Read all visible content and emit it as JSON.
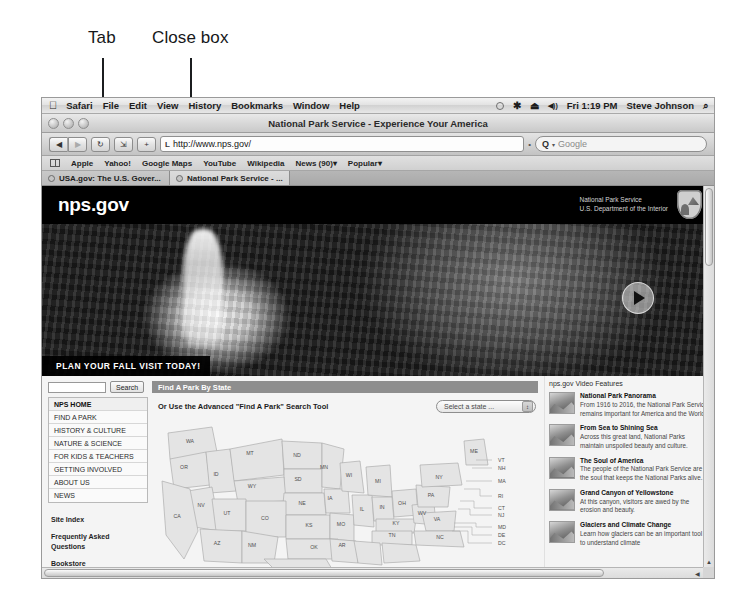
{
  "annotations": [
    {
      "label": "Tab",
      "x": 88,
      "y": 36,
      "line_x": 102,
      "line_top": 58,
      "line_bottom": 112
    },
    {
      "label": "Close box",
      "x": 152,
      "y": 36,
      "line_x": 190,
      "line_top": 58,
      "line_bottom": 112
    }
  ],
  "menubar": {
    "apple_icon": "apple-icon",
    "items": [
      "Safari",
      "File",
      "Edit",
      "View",
      "History",
      "Bookmarks",
      "Window",
      "Help"
    ],
    "status": {
      "spotlight_circle": "",
      "bluetooth_icon": "✱",
      "eject_icon": "⏏",
      "volume_icon": "◀))",
      "clock": "Fri 1:19 PM",
      "user": "Steve Johnson",
      "search_icon": "⌕"
    }
  },
  "window": {
    "title": "National Park Service - Experience Your America",
    "traffic_lights": [
      "close",
      "minimize",
      "zoom"
    ]
  },
  "toolbar": {
    "back_icon": "◀",
    "forward_icon": "▶",
    "reload_icon": "↻",
    "reader_label": "Reader",
    "add_label": "+",
    "url_favicon": "L",
    "url": "http://www.nps.gov/",
    "search_prefix": "Q",
    "search_placeholder": "Google",
    "separator": "•"
  },
  "bookmarks": {
    "show_all_icon": "bookmarks-icon",
    "items": [
      "Apple",
      "Yahoo!",
      "Google Maps",
      "YouTube",
      "Wikipedia",
      "News (90)",
      "Popular"
    ]
  },
  "tabs": [
    {
      "label": "USA.gov: The U.S. Gover...",
      "active": false
    },
    {
      "label": "National Park Service - ...",
      "active": true
    }
  ],
  "hero": {
    "logo": "nps.gov",
    "agency_line1": "National Park Service",
    "agency_line2": "U.S. Department of the Interior",
    "caption": "PLAN YOUR FALL VISIT TODAY!",
    "play_label": "play-button"
  },
  "sidebar": {
    "search_value": "",
    "search_button": "Search",
    "nav": [
      {
        "label": "NPS HOME",
        "current": true
      },
      {
        "label": "FIND A PARK",
        "current": false
      },
      {
        "label": "HISTORY & CULTURE",
        "current": false
      },
      {
        "label": "NATURE & SCIENCE",
        "current": false
      },
      {
        "label": "FOR KIDS & TEACHERS",
        "current": false
      },
      {
        "label": "GETTING INVOLVED",
        "current": false
      },
      {
        "label": "ABOUT US",
        "current": false
      },
      {
        "label": "NEWS",
        "current": false
      }
    ],
    "sublinks": [
      "Site Index",
      "Frequently Asked Questions",
      "Bookstore"
    ]
  },
  "main": {
    "section_title": "Find A Park By State",
    "advanced_text": "Or Use the Advanced \"Find A Park\" Search Tool",
    "state_select_value": "Select a state ...",
    "select_arrow_icon": "↕",
    "map": {
      "states": [
        {
          "abbr": "WA",
          "x": 36,
          "y": 24
        },
        {
          "abbr": "OR",
          "x": 30,
          "y": 50
        },
        {
          "abbr": "ID",
          "x": 62,
          "y": 57
        },
        {
          "abbr": "MT",
          "x": 96,
          "y": 36
        },
        {
          "abbr": "ND",
          "x": 143,
          "y": 38
        },
        {
          "abbr": "SD",
          "x": 144,
          "y": 62
        },
        {
          "abbr": "MN",
          "x": 170,
          "y": 50
        },
        {
          "abbr": "WY",
          "x": 98,
          "y": 69
        },
        {
          "abbr": "NE",
          "x": 148,
          "y": 86
        },
        {
          "abbr": "IA",
          "x": 176,
          "y": 81
        },
        {
          "abbr": "NV",
          "x": 47,
          "y": 88
        },
        {
          "abbr": "UT",
          "x": 73,
          "y": 96
        },
        {
          "abbr": "CO",
          "x": 111,
          "y": 101
        },
        {
          "abbr": "KS",
          "x": 155,
          "y": 108
        },
        {
          "abbr": "MO",
          "x": 187,
          "y": 107
        },
        {
          "abbr": "CA",
          "x": 23,
          "y": 99
        },
        {
          "abbr": "AZ",
          "x": 63,
          "y": 126
        },
        {
          "abbr": "NM",
          "x": 98,
          "y": 128
        },
        {
          "abbr": "OK",
          "x": 160,
          "y": 130
        },
        {
          "abbr": "AR",
          "x": 188,
          "y": 128
        },
        {
          "abbr": "TX",
          "x": 140,
          "y": 152
        },
        {
          "abbr": "WI",
          "x": 195,
          "y": 58
        },
        {
          "abbr": "IL",
          "x": 208,
          "y": 92
        },
        {
          "abbr": "MI",
          "x": 224,
          "y": 64
        },
        {
          "abbr": "IN",
          "x": 228,
          "y": 90
        },
        {
          "abbr": "OH",
          "x": 248,
          "y": 86
        },
        {
          "abbr": "KY",
          "x": 242,
          "y": 106
        },
        {
          "abbr": "TN",
          "x": 238,
          "y": 118
        },
        {
          "abbr": "WV",
          "x": 268,
          "y": 96
        },
        {
          "abbr": "VA",
          "x": 283,
          "y": 102
        },
        {
          "abbr": "NC",
          "x": 286,
          "y": 120
        },
        {
          "abbr": "PA",
          "x": 277,
          "y": 78
        },
        {
          "abbr": "NY",
          "x": 285,
          "y": 60
        },
        {
          "abbr": "ME",
          "x": 320,
          "y": 34
        }
      ],
      "leader_labels": [
        {
          "abbr": "VT",
          "x": 344,
          "y": 41
        },
        {
          "abbr": "NH",
          "x": 344,
          "y": 49
        },
        {
          "abbr": "MA",
          "x": 344,
          "y": 62
        },
        {
          "abbr": "RI",
          "x": 344,
          "y": 77
        },
        {
          "abbr": "CT",
          "x": 344,
          "y": 89
        },
        {
          "abbr": "NJ",
          "x": 344,
          "y": 96
        },
        {
          "abbr": "MD",
          "x": 344,
          "y": 108
        },
        {
          "abbr": "DE",
          "x": 344,
          "y": 116
        },
        {
          "abbr": "DC",
          "x": 344,
          "y": 124
        }
      ]
    }
  },
  "video_features": {
    "heading": "nps.gov Video Features",
    "items": [
      {
        "title": "National Park Panorama",
        "desc": "From 1916 to 2016, the National Park Service remains important for America and the World.",
        "thumb": "panorama-thumbnail"
      },
      {
        "title": "From Sea to Shining Sea",
        "desc": "Across this great land, National Parks maintain unspoiled beauty and culture.",
        "thumb": "seascape-thumbnail"
      },
      {
        "title": "The Soul of America",
        "desc": "The people of the National Park Service are the soul that keeps the National Parks alive.",
        "thumb": "statue-thumbnail"
      },
      {
        "title": "Grand Canyon of Yellowstone",
        "desc": "At this canyon, visitors are awed by the erosion and beauty.",
        "thumb": "canyon-thumbnail"
      },
      {
        "title": "Glaciers and Climate Change",
        "desc": "Learn how glaciers can be an important tool to understand climate",
        "thumb": "glacier-thumbnail"
      }
    ]
  },
  "scrollbars": {
    "up_arrow": "▲",
    "down_arrow": "▼",
    "left_arrow": "◀",
    "right_arrow": "▶"
  }
}
